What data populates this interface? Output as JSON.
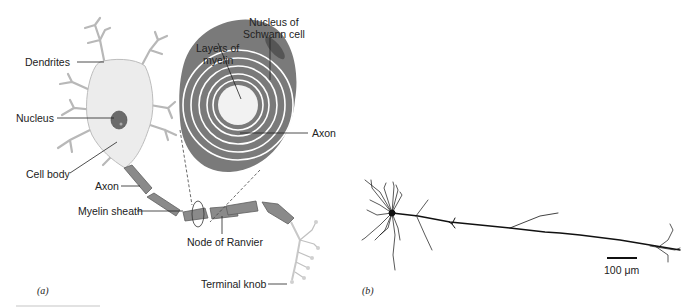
{
  "figure": {
    "panel_a": {
      "id_label": "(a)",
      "labels": {
        "dendrites": "Dendrites",
        "nucleus": "Nucleus",
        "cell_body": "Cell body",
        "axon": "Axon",
        "myelin_sheath": "Myelin sheath",
        "node_of_ranvier": "Node of Ranvier",
        "terminal_knob": "Terminal knob",
        "layers_of_myelin_1": "Layers of",
        "layers_of_myelin_2": "myelin",
        "nucleus_schwann_1": "Nucleus of",
        "nucleus_schwann_2": "Schwann cell",
        "axon_cross_section": "Axon"
      }
    },
    "panel_b": {
      "id_label": "(b)",
      "scale_bar": "100 μm"
    },
    "colors": {
      "cell_fill": "#ececec",
      "cell_stroke": "#b0b0b0",
      "myelin": "#8a8a8a",
      "myelin_dark": "#5e5e5e",
      "nucleus": "#6b6b6b",
      "text": "#222222"
    }
  }
}
